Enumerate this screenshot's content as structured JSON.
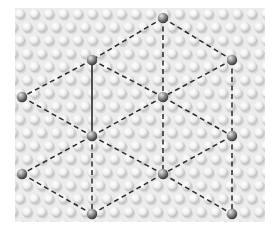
{
  "diagram": {
    "title": "",
    "type": "lattice-unit-cell",
    "width": 280,
    "height": 232,
    "panel": {
      "x": 15,
      "y": 8,
      "width": 250,
      "height": 214,
      "color": "#ececec"
    },
    "beads": {
      "pitch_x": 14.5,
      "pitch_y": 13.2,
      "radius": 5.2,
      "x0": 20,
      "y0": 14,
      "stagger": 7.25,
      "color_light": "#ffffff",
      "color_dark": "#b9b9b9"
    },
    "colors": {
      "edge": "#2a2a2a",
      "node_light": "#d0d0d0",
      "node_dark": "#3a3a3a"
    },
    "nodes": [
      {
        "id": "n0",
        "x": 163,
        "y": 18
      },
      {
        "id": "n1",
        "x": 92,
        "y": 60
      },
      {
        "id": "n2",
        "x": 232,
        "y": 60
      },
      {
        "id": "n3",
        "x": 22,
        "y": 97
      },
      {
        "id": "n4",
        "x": 163,
        "y": 97
      },
      {
        "id": "n5",
        "x": 92,
        "y": 136
      },
      {
        "id": "n6",
        "x": 232,
        "y": 136
      },
      {
        "id": "n7",
        "x": 22,
        "y": 174
      },
      {
        "id": "n8",
        "x": 163,
        "y": 174
      },
      {
        "id": "n9",
        "x": 92,
        "y": 214
      },
      {
        "id": "n10",
        "x": 232,
        "y": 214
      }
    ],
    "edges": [
      {
        "from": "n0",
        "to": "n1",
        "style": "dashed"
      },
      {
        "from": "n0",
        "to": "n2",
        "style": "dashed"
      },
      {
        "from": "n0",
        "to": "n4",
        "style": "dashed"
      },
      {
        "from": "n1",
        "to": "n3",
        "style": "dashed"
      },
      {
        "from": "n1",
        "to": "n4",
        "style": "dashed"
      },
      {
        "from": "n1",
        "to": "n5",
        "style": "solid"
      },
      {
        "from": "n2",
        "to": "n4",
        "style": "dashed"
      },
      {
        "from": "n2",
        "to": "n6",
        "style": "dashed"
      },
      {
        "from": "n3",
        "to": "n5",
        "style": "dashed"
      },
      {
        "from": "n4",
        "to": "n5",
        "style": "dashed"
      },
      {
        "from": "n4",
        "to": "n6",
        "style": "dashed"
      },
      {
        "from": "n4",
        "to": "n8",
        "style": "dashed"
      },
      {
        "from": "n5",
        "to": "n7",
        "style": "dashed"
      },
      {
        "from": "n5",
        "to": "n8",
        "style": "dashed"
      },
      {
        "from": "n5",
        "to": "n9",
        "style": "dashed"
      },
      {
        "from": "n6",
        "to": "n8",
        "style": "dashed"
      },
      {
        "from": "n6",
        "to": "n10",
        "style": "dashed"
      },
      {
        "from": "n7",
        "to": "n9",
        "style": "dashed"
      },
      {
        "from": "n8",
        "to": "n9",
        "style": "dashed"
      },
      {
        "from": "n8",
        "to": "n10",
        "style": "dashed"
      }
    ]
  }
}
